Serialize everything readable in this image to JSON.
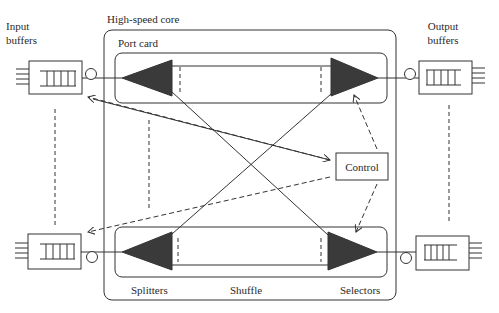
{
  "diagram": {
    "title_core": "High-speed core",
    "port_card": "Port card",
    "input_buffers_line1": "Input",
    "input_buffers_line2": "buffers",
    "output_buffers_line1": "Output",
    "output_buffers_line2": "buffers",
    "control": "Control",
    "splitters": "Splitters",
    "shuffle": "Shuffle",
    "selectors": "Selectors"
  },
  "colors": {
    "stroke": "#333333",
    "triangle_fill": "#3a3a3a",
    "background": "#ffffff"
  }
}
